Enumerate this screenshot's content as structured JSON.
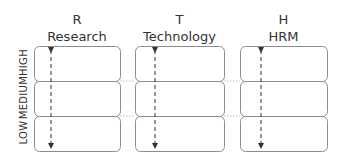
{
  "columns": [
    {
      "letter": "R",
      "name": "Research"
    },
    {
      "letter": "T",
      "name": "Technology"
    },
    {
      "letter": "H",
      "name": "HRM"
    }
  ],
  "rows": [
    {
      "label": "HIGH"
    },
    {
      "label": "MEDIUM"
    },
    {
      "label": "LOW"
    }
  ],
  "colors": {
    "box_stroke": "#8c8c8c",
    "arrow": "#333333",
    "connector": "#b0b0b0",
    "text": "#333333"
  }
}
